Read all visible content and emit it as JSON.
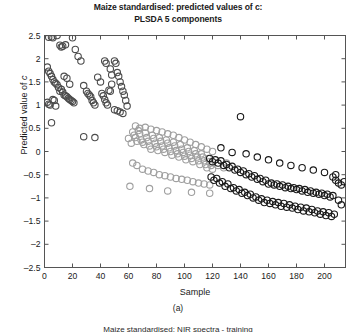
{
  "figure": {
    "title_line1": "Maize standardised: predicted values of c:",
    "title_line2": "PLSDA 5 components",
    "caption": "(a)",
    "subcaption_clipped": "Maize standardised: NIR spectra - training",
    "ylabel_prefix": "Predicted value of ",
    "ylabel_italic": "c",
    "xlabel": "Sample"
  },
  "chart_data": {
    "type": "scatter",
    "title": "Maize standardised: predicted values of c: PLSDA 5 components",
    "xlabel": "Sample",
    "ylabel": "Predicted value of c",
    "xlim": [
      0,
      215
    ],
    "ylim": [
      -2.5,
      2.5
    ],
    "xticks": [
      0,
      20,
      40,
      60,
      80,
      100,
      120,
      140,
      160,
      180,
      200
    ],
    "yticks": [
      -2.5,
      -2,
      -1.5,
      -1,
      -0.5,
      0,
      0.5,
      1,
      1.5,
      2,
      2.5
    ],
    "grid": false,
    "legend": "none",
    "marker": "open-circle",
    "marker_size": 5,
    "series": [
      {
        "name": "class-1-dark-gray",
        "color": "#4d4d4d",
        "points": [
          [
            3,
            2.46
          ],
          [
            5,
            2.47
          ],
          [
            6,
            2.45
          ],
          [
            9,
            2.5
          ],
          [
            11,
            2.29
          ],
          [
            12,
            2.25
          ],
          [
            13,
            2.27
          ],
          [
            15,
            2.3
          ],
          [
            20,
            2.45
          ],
          [
            22,
            2.2
          ],
          [
            2,
            1.82
          ],
          [
            3,
            1.73
          ],
          [
            4,
            1.68
          ],
          [
            5,
            1.62
          ],
          [
            6,
            1.55
          ],
          [
            7,
            1.5
          ],
          [
            8,
            1.47
          ],
          [
            9,
            1.44
          ],
          [
            10,
            1.38
          ],
          [
            11,
            1.3
          ],
          [
            12,
            1.34
          ],
          [
            13,
            1.28
          ],
          [
            14,
            1.22
          ],
          [
            15,
            1.2
          ],
          [
            16,
            1.18
          ],
          [
            17,
            1.15
          ],
          [
            18,
            1.12
          ],
          [
            19,
            1.1
          ],
          [
            20,
            1.08
          ],
          [
            21,
            1.05
          ],
          [
            2,
            1.06
          ],
          [
            3,
            1.02
          ],
          [
            4,
            1.0
          ],
          [
            6,
            1.12
          ],
          [
            7,
            1.1
          ],
          [
            8,
            0.98
          ],
          [
            5,
            0.62
          ],
          [
            14,
            1.62
          ],
          [
            16,
            1.58
          ],
          [
            18,
            1.45
          ],
          [
            24,
            2.05
          ],
          [
            26,
            1.95
          ],
          [
            28,
            1.42
          ],
          [
            30,
            1.3
          ],
          [
            31,
            1.25
          ],
          [
            32,
            1.22
          ],
          [
            33,
            1.18
          ],
          [
            34,
            1.1
          ],
          [
            35,
            1.05
          ],
          [
            36,
            1.0
          ],
          [
            38,
            1.6
          ],
          [
            40,
            1.5
          ],
          [
            41,
            1.25
          ],
          [
            42,
            1.2
          ],
          [
            43,
            1.12
          ],
          [
            44,
            1.05
          ],
          [
            45,
            1.0
          ],
          [
            46,
            1.32
          ],
          [
            47,
            1.3
          ],
          [
            48,
            1.45
          ],
          [
            50,
            1.95
          ],
          [
            51,
            1.9
          ],
          [
            52,
            1.7
          ],
          [
            53,
            1.62
          ],
          [
            54,
            1.5
          ],
          [
            55,
            1.4
          ],
          [
            56,
            1.3
          ],
          [
            57,
            1.22
          ],
          [
            58,
            1.1
          ],
          [
            59,
            0.98
          ],
          [
            50,
            0.9
          ],
          [
            52,
            0.88
          ],
          [
            54,
            0.85
          ],
          [
            56,
            0.82
          ],
          [
            36,
            0.3
          ],
          [
            28,
            0.32
          ],
          [
            43,
            1.95
          ],
          [
            44,
            1.9
          ],
          [
            47,
            1.78
          ],
          [
            48,
            1.65
          ]
        ]
      },
      {
        "name": "class-2-light-gray",
        "color": "#a0a0a0",
        "points": [
          [
            60,
            0.28
          ],
          [
            62,
            0.18
          ],
          [
            63,
            0.42
          ],
          [
            64,
            0.35
          ],
          [
            65,
            0.3
          ],
          [
            66,
            0.22
          ],
          [
            67,
            0.45
          ],
          [
            68,
            0.38
          ],
          [
            69,
            0.25
          ],
          [
            70,
            0.2
          ],
          [
            71,
            0.15
          ],
          [
            72,
            0.4
          ],
          [
            73,
            0.3
          ],
          [
            74,
            0.22
          ],
          [
            75,
            0.12
          ],
          [
            76,
            0.05
          ],
          [
            77,
            0.35
          ],
          [
            78,
            0.28
          ],
          [
            79,
            0.18
          ],
          [
            80,
            0.1
          ],
          [
            81,
            0.02
          ],
          [
            82,
            0.3
          ],
          [
            83,
            0.22
          ],
          [
            84,
            0.12
          ],
          [
            85,
            0.05
          ],
          [
            86,
            -0.02
          ],
          [
            87,
            0.25
          ],
          [
            88,
            0.18
          ],
          [
            89,
            0.08
          ],
          [
            90,
            0.0
          ],
          [
            91,
            -0.08
          ],
          [
            92,
            0.2
          ],
          [
            93,
            0.12
          ],
          [
            94,
            0.02
          ],
          [
            95,
            -0.05
          ],
          [
            96,
            -0.12
          ],
          [
            97,
            0.15
          ],
          [
            98,
            0.05
          ],
          [
            99,
            -0.02
          ],
          [
            100,
            -0.1
          ],
          [
            101,
            -0.18
          ],
          [
            102,
            0.08
          ],
          [
            103,
            0.0
          ],
          [
            104,
            -0.08
          ],
          [
            105,
            -0.15
          ],
          [
            106,
            -0.22
          ],
          [
            107,
            0.02
          ],
          [
            108,
            -0.05
          ],
          [
            109,
            -0.12
          ],
          [
            110,
            -0.2
          ],
          [
            111,
            -0.28
          ],
          [
            112,
            -0.05
          ],
          [
            113,
            -0.12
          ],
          [
            114,
            -0.2
          ],
          [
            115,
            -0.28
          ],
          [
            116,
            -0.35
          ],
          [
            117,
            -0.15
          ],
          [
            118,
            -0.22
          ],
          [
            119,
            -0.3
          ],
          [
            120,
            -0.38
          ],
          [
            63,
            -0.25
          ],
          [
            66,
            -0.3
          ],
          [
            70,
            -0.38
          ],
          [
            74,
            -0.42
          ],
          [
            78,
            -0.45
          ],
          [
            82,
            -0.5
          ],
          [
            86,
            -0.52
          ],
          [
            90,
            -0.55
          ],
          [
            94,
            -0.58
          ],
          [
            98,
            -0.6
          ],
          [
            102,
            -0.62
          ],
          [
            106,
            -0.65
          ],
          [
            110,
            -0.68
          ],
          [
            114,
            -0.7
          ],
          [
            118,
            -0.72
          ],
          [
            65,
            0.55
          ],
          [
            68,
            0.5
          ],
          [
            72,
            0.52
          ],
          [
            76,
            0.48
          ],
          [
            80,
            0.45
          ],
          [
            84,
            0.42
          ],
          [
            88,
            0.38
          ],
          [
            92,
            0.35
          ],
          [
            96,
            0.3
          ],
          [
            100,
            0.25
          ],
          [
            104,
            0.2
          ],
          [
            108,
            0.15
          ],
          [
            112,
            0.1
          ],
          [
            116,
            0.05
          ],
          [
            120,
            0.0
          ],
          [
            61,
            -0.75
          ],
          [
            75,
            -0.8
          ],
          [
            88,
            -0.85
          ],
          [
            105,
            -0.88
          ],
          [
            118,
            -0.9
          ],
          [
            124,
            -0.3
          ],
          [
            128,
            -0.35
          ],
          [
            130,
            -0.25
          ]
        ]
      },
      {
        "name": "class-3-black",
        "color": "#1a1a1a",
        "points": [
          [
            118,
            -0.15
          ],
          [
            120,
            -0.22
          ],
          [
            122,
            -0.18
          ],
          [
            124,
            -0.25
          ],
          [
            126,
            -0.2
          ],
          [
            128,
            -0.3
          ],
          [
            130,
            -0.28
          ],
          [
            132,
            -0.35
          ],
          [
            134,
            -0.32
          ],
          [
            136,
            -0.4
          ],
          [
            138,
            -0.38
          ],
          [
            140,
            -0.45
          ],
          [
            142,
            -0.42
          ],
          [
            144,
            -0.5
          ],
          [
            146,
            -0.48
          ],
          [
            148,
            -0.55
          ],
          [
            150,
            -0.52
          ],
          [
            152,
            -0.6
          ],
          [
            154,
            -0.58
          ],
          [
            156,
            -0.65
          ],
          [
            158,
            -0.62
          ],
          [
            160,
            -0.7
          ],
          [
            162,
            -0.68
          ],
          [
            164,
            -0.72
          ],
          [
            166,
            -0.7
          ],
          [
            168,
            -0.75
          ],
          [
            170,
            -0.72
          ],
          [
            172,
            -0.78
          ],
          [
            174,
            -0.75
          ],
          [
            176,
            -0.8
          ],
          [
            178,
            -0.78
          ],
          [
            180,
            -0.82
          ],
          [
            182,
            -0.8
          ],
          [
            184,
            -0.85
          ],
          [
            186,
            -0.82
          ],
          [
            188,
            -0.88
          ],
          [
            190,
            -0.85
          ],
          [
            192,
            -0.9
          ],
          [
            194,
            -0.88
          ],
          [
            196,
            -0.92
          ],
          [
            198,
            -0.9
          ],
          [
            200,
            -0.95
          ],
          [
            202,
            -0.92
          ],
          [
            204,
            -0.98
          ],
          [
            206,
            -0.95
          ],
          [
            208,
            -0.62
          ],
          [
            210,
            -0.68
          ],
          [
            212,
            -0.72
          ],
          [
            214,
            -0.65
          ],
          [
            119,
            -0.55
          ],
          [
            121,
            -0.62
          ],
          [
            123,
            -0.58
          ],
          [
            125,
            -0.68
          ],
          [
            127,
            -0.65
          ],
          [
            129,
            -0.75
          ],
          [
            131,
            -0.7
          ],
          [
            133,
            -0.8
          ],
          [
            135,
            -0.78
          ],
          [
            137,
            -0.85
          ],
          [
            139,
            -0.82
          ],
          [
            141,
            -0.9
          ],
          [
            143,
            -0.88
          ],
          [
            145,
            -0.95
          ],
          [
            147,
            -0.92
          ],
          [
            149,
            -1.0
          ],
          [
            151,
            -0.98
          ],
          [
            153,
            -1.05
          ],
          [
            155,
            -1.02
          ],
          [
            157,
            -1.1
          ],
          [
            159,
            -1.05
          ],
          [
            161,
            -1.12
          ],
          [
            163,
            -1.08
          ],
          [
            165,
            -1.15
          ],
          [
            167,
            -1.1
          ],
          [
            169,
            -1.18
          ],
          [
            171,
            -1.12
          ],
          [
            173,
            -1.2
          ],
          [
            175,
            -1.15
          ],
          [
            177,
            -1.22
          ],
          [
            179,
            -1.18
          ],
          [
            181,
            -1.25
          ],
          [
            183,
            -1.2
          ],
          [
            185,
            -1.28
          ],
          [
            187,
            -1.22
          ],
          [
            189,
            -1.3
          ],
          [
            191,
            -1.25
          ],
          [
            193,
            -1.32
          ],
          [
            195,
            -1.28
          ],
          [
            197,
            -1.35
          ],
          [
            199,
            -1.3
          ],
          [
            201,
            -1.38
          ],
          [
            203,
            -1.32
          ],
          [
            205,
            -1.4
          ],
          [
            207,
            -1.35
          ],
          [
            140,
            0.75
          ],
          [
            126,
            0.08
          ],
          [
            134,
            -0.02
          ],
          [
            144,
            -0.05
          ],
          [
            152,
            -0.12
          ],
          [
            160,
            -0.18
          ],
          [
            168,
            -0.25
          ],
          [
            176,
            -0.3
          ],
          [
            184,
            -0.35
          ],
          [
            192,
            -0.4
          ],
          [
            200,
            -0.45
          ],
          [
            208,
            -0.5
          ],
          [
            212,
            -1.15
          ],
          [
            210,
            -1.05
          ],
          [
            206,
            -0.55
          ]
        ]
      }
    ]
  }
}
